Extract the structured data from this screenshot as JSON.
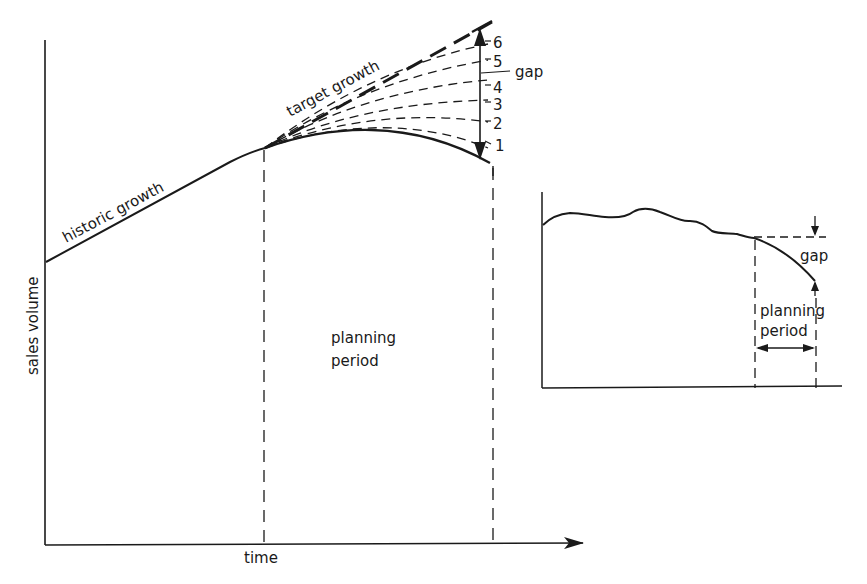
{
  "main_chart": {
    "y_axis_label": "sales volume",
    "x_axis_label": "time",
    "historic_label": "historic growth",
    "target_label": "target growth",
    "planning_label_line1": "planning",
    "planning_label_line2": "period",
    "gap_label": "gap",
    "projection_numbers": [
      "6",
      "5",
      "4",
      "3",
      "2",
      "1"
    ]
  },
  "inset_chart": {
    "gap_label": "gap",
    "planning_label_line1": "planning",
    "planning_label_line2": "period"
  },
  "colors": {
    "ink": "#1a1a1a",
    "background": "#ffffff"
  }
}
